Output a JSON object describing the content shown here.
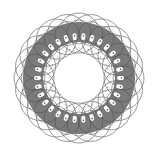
{
  "figure": {
    "type": "spirograph-ring-pattern",
    "center": [
      79,
      78
    ],
    "outer_circles": {
      "count": 24,
      "ring_radius": 45,
      "circle_radius": 20,
      "stroke": "#6e6e6e"
    },
    "annulus": {
      "outer_radius": 56,
      "inner_radius": 36,
      "fill": "#7a7a7a"
    },
    "teeth": {
      "count": 30,
      "radius": 41,
      "fill": "#ffffff"
    },
    "inner_dots": {
      "count": 40,
      "radius": 30,
      "fill": "#9a9a9a"
    },
    "background": "#ffffff"
  }
}
